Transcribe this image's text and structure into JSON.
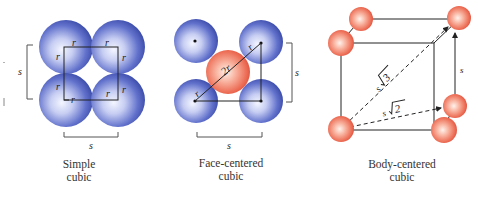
{
  "colors": {
    "blue_sphere_edge": "#3a4aa8",
    "blue_sphere_highlight": "#f4f6ff",
    "red_sphere_edge": "#e0503a",
    "red_sphere_highlight": "#fff2ec",
    "line": "#222222"
  },
  "panels": [
    {
      "name": "simple-cubic",
      "caption_line1": "Simple",
      "caption_line2": "cubic",
      "radius_label": "r",
      "side_label": "s"
    },
    {
      "name": "face-centered-cubic",
      "caption_line1": "Face-centered",
      "caption_line2": "cubic",
      "diag_label_r": "r",
      "diag_label_2r": "2r",
      "side_label": "s"
    },
    {
      "name": "body-centered-cubic",
      "caption_line1": "Body-centered",
      "caption_line2": "cubic",
      "body_diag_label": "s",
      "body_diag_root": "3",
      "face_diag_label": "s",
      "face_diag_root": "2",
      "edge_label": "s"
    }
  ]
}
